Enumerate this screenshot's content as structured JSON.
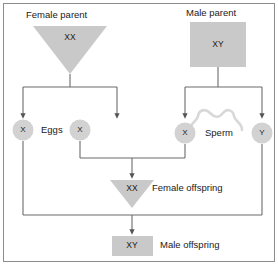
{
  "figure": {
    "colors": {
      "shape_fill": "#c9c9c9",
      "gamete_fill": "#d2d2d2",
      "line": "#6b6b6b",
      "brace": "#d8d8d8",
      "border": "#8c8c8c",
      "text": "#1a1a1a",
      "background": "#ffffff"
    }
  },
  "parents": {
    "female": {
      "label": "Female parent",
      "genotype": "XX",
      "shape": "triangle-down"
    },
    "male": {
      "label": "Male parent",
      "genotype": "XY",
      "shape": "square"
    }
  },
  "gametes": {
    "eggs": {
      "label": "Eggs",
      "cells": [
        {
          "allele": "X"
        },
        {
          "allele": "X"
        }
      ]
    },
    "sperm": {
      "label": "Sperm",
      "cells": [
        {
          "allele": "X"
        },
        {
          "allele": "Y"
        }
      ]
    }
  },
  "offspring": [
    {
      "genotype": "XX",
      "label": "Female offspring",
      "shape": "triangle-down"
    },
    {
      "genotype": "XY",
      "label": "Male offspring",
      "shape": "square"
    }
  ]
}
